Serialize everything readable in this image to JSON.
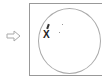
{
  "nav": {
    "arrow_icon": "arrow-right-outline-icon"
  },
  "canvas": {
    "marker_label": "X",
    "shape": "circle"
  },
  "colors": {
    "border": "#999999",
    "circle": "#aaaaaa",
    "marker": "#222222"
  }
}
